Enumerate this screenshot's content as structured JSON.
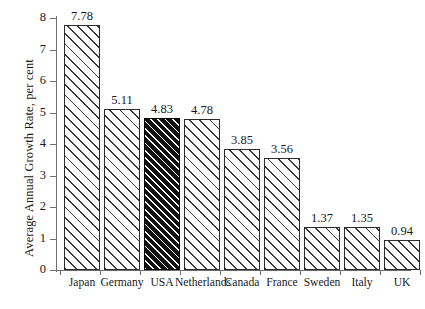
{
  "chart_data": {
    "type": "bar",
    "title": "",
    "xlabel": "",
    "ylabel": "Average Annual Growth Rate, per cent",
    "ylim": [
      0,
      8
    ],
    "yticks": [
      "0",
      "1",
      "2",
      "3",
      "4",
      "5",
      "6",
      "7",
      "8"
    ],
    "grid": false,
    "legend": false,
    "categories": [
      "Japan",
      "Germany",
      "USA",
      "Netherlands",
      "Canada",
      "France",
      "Sweden",
      "Italy",
      "UK"
    ],
    "values": [
      7.78,
      5.11,
      4.83,
      4.78,
      3.85,
      3.56,
      1.37,
      1.35,
      0.94
    ],
    "value_labels": [
      "7.78",
      "5.11",
      "4.83",
      "4.78",
      "3.85",
      "3.56",
      "1.37",
      "1.35",
      "0.94"
    ],
    "highlight_index": 2,
    "colors": {
      "bar_fill": "#ffffff",
      "bar_hatch": "#3a3a3a",
      "bar_border": "#2b2b2b",
      "highlight_fill": "#111111",
      "highlight_hatch": "#ffffff",
      "axis": "#6e6e6e",
      "text": "#1a1a1a",
      "background": "#ffffff"
    }
  }
}
